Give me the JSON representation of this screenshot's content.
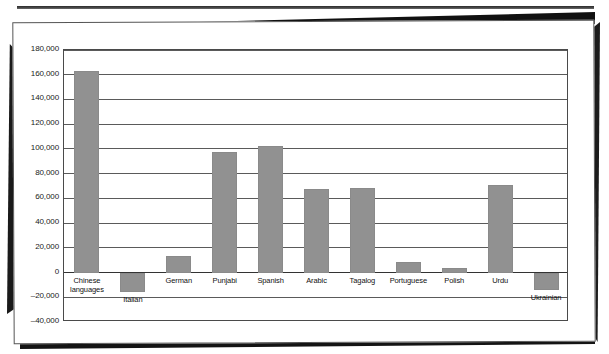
{
  "figure": {
    "background_color": "#ffffff",
    "bar_color": "#919191",
    "axis_color": "#4a4a4a",
    "text_color": "#111111"
  },
  "axis": {
    "y_tick_labels": [
      "180,000",
      "160,000",
      "140,000",
      "120,000",
      "100,000",
      "80,000",
      "60,000",
      "40,000",
      "20,000",
      "0",
      "–20,000",
      "–40,000"
    ]
  },
  "chart_data": {
    "type": "bar",
    "title": "",
    "subtitle": "",
    "xlabel": "",
    "ylabel": "",
    "grid": true,
    "legend": "none",
    "ylim": [
      -40000,
      180000
    ],
    "ytick_step": 20000,
    "yticks": [
      180000,
      160000,
      140000,
      120000,
      100000,
      80000,
      60000,
      40000,
      20000,
      0,
      -20000,
      -40000
    ],
    "categories": [
      "Chinese\nlanguages",
      "Italian",
      "German",
      "Punjabi",
      "Spanish",
      "Arabic",
      "Tagalog",
      "Portuguese",
      "Polish",
      "Urdu",
      "Ukrainian"
    ],
    "values": [
      163000,
      -16000,
      13000,
      97500,
      102500,
      67500,
      68500,
      8500,
      4000,
      71000,
      -14500
    ]
  }
}
